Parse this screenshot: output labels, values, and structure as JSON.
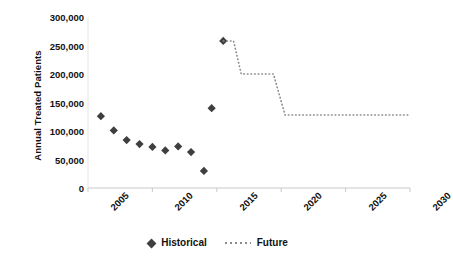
{
  "chart_data": {
    "type": "scatter",
    "title": "",
    "xlabel": "",
    "ylabel": "Annual Treated Patients",
    "xlim": [
      2005,
      2030
    ],
    "ylim": [
      0,
      300000
    ],
    "grid": false,
    "legend_position": "bottom-center",
    "y_ticks": [
      300000,
      250000,
      200000,
      150000,
      100000,
      50000,
      0
    ],
    "y_tick_labels": [
      "300,000",
      "250,000",
      "200,000",
      "150,000",
      "100,000",
      "50,000",
      "0"
    ],
    "x_ticks": [
      2005,
      2010,
      2015,
      2020,
      2025,
      2030
    ],
    "x_tick_labels": [
      "2005",
      "2010",
      "2015",
      "2020",
      "2025",
      "2030"
    ],
    "series": [
      {
        "name": "Historical",
        "type": "scatter",
        "marker": "diamond",
        "color": "#3f3f3f",
        "points": [
          {
            "x": 2006.0,
            "y": 126000
          },
          {
            "x": 2007.0,
            "y": 101000
          },
          {
            "x": 2008.0,
            "y": 84000
          },
          {
            "x": 2009.0,
            "y": 77000
          },
          {
            "x": 2010.0,
            "y": 72000
          },
          {
            "x": 2011.0,
            "y": 66000
          },
          {
            "x": 2012.0,
            "y": 73000
          },
          {
            "x": 2013.0,
            "y": 63000
          },
          {
            "x": 2014.0,
            "y": 30000
          },
          {
            "x": 2014.6,
            "y": 140000
          },
          {
            "x": 2015.5,
            "y": 258000
          }
        ]
      },
      {
        "name": "Future",
        "type": "line",
        "style": "dotted",
        "color": "#8a8a8a",
        "points": [
          {
            "x": 2015.5,
            "y": 258000
          },
          {
            "x": 2016.3,
            "y": 258000
          },
          {
            "x": 2016.9,
            "y": 200000
          },
          {
            "x": 2019.4,
            "y": 200000
          },
          {
            "x": 2020.3,
            "y": 128000
          },
          {
            "x": 2030.0,
            "y": 128000
          }
        ]
      }
    ],
    "legend": [
      {
        "label": "Historical",
        "marker": "diamond",
        "color": "#3f3f3f"
      },
      {
        "label": "Future",
        "marker": "dotted-line",
        "color": "#8a8a8a"
      }
    ],
    "axis_color": "#c9c9c9"
  }
}
